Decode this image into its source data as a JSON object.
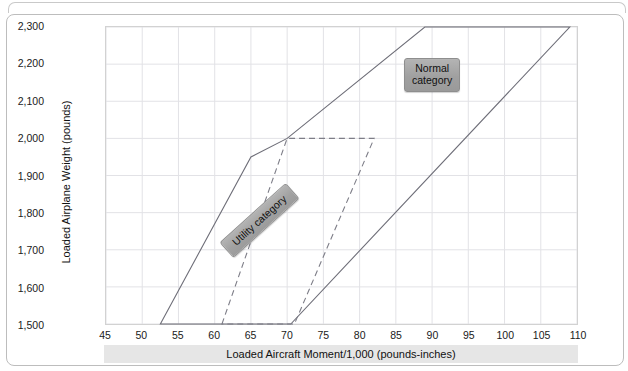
{
  "chart_data": {
    "type": "line",
    "title": "",
    "xlabel": "Loaded Aircraft Moment/1,000 (pounds-inches)",
    "ylabel": "Loaded  Airplane Weight (pounds)",
    "xlim": [
      45,
      110
    ],
    "ylim": [
      1500,
      2300
    ],
    "xticks": [
      45,
      50,
      55,
      60,
      65,
      70,
      75,
      80,
      85,
      90,
      95,
      100,
      105,
      110
    ],
    "yticks": [
      1500,
      1600,
      1700,
      1800,
      1900,
      2000,
      2100,
      2200,
      2300
    ],
    "xtick_labels": [
      "45",
      "50",
      "55",
      "60",
      "65",
      "70",
      "75",
      "80",
      "85",
      "90",
      "95",
      "100",
      "105",
      "110"
    ],
    "ytick_labels": [
      "1,500",
      "1,600",
      "1,700",
      "1,800",
      "1,900",
      "2,000",
      "2,100",
      "2,200",
      "2,300"
    ],
    "grid": true,
    "legend": "none",
    "series": [
      {
        "name": "Normal category",
        "style": "solid",
        "color": "#6e6e78",
        "closed": true,
        "points": [
          [
            52.5,
            1500
          ],
          [
            65.0,
            1950
          ],
          [
            70.0,
            2000
          ],
          [
            89.0,
            2300
          ],
          [
            109.0,
            2300
          ],
          [
            70.5,
            1500
          ]
        ]
      },
      {
        "name": "Utility category",
        "style": "dashed",
        "color": "#7d7d87",
        "closed": true,
        "points": [
          [
            61.0,
            1500
          ],
          [
            70.0,
            2000
          ],
          [
            82.0,
            2000
          ],
          [
            71.0,
            1500
          ]
        ]
      }
    ],
    "annotations": [
      {
        "name": "normal-category-label",
        "text": "Normal\ncategory",
        "x": 93,
        "y": 2205
      },
      {
        "name": "utility-category-label",
        "text": "Utility category",
        "x": 67,
        "y": 1790,
        "rotation": -42
      }
    ]
  },
  "axes": {
    "y_title": "Loaded  Airplane Weight (pounds)",
    "x_title": "Loaded Aircraft Moment/1,000 (pounds-inches)"
  },
  "labels": {
    "normal_category": "Normal\ncategory",
    "utility_category": "Utility category"
  },
  "colors": {
    "normal_line": "#6e6e78",
    "utility_line": "#7d7d87",
    "grid": "#e2e2e6",
    "axis_border": "#d2d2d2",
    "label_box": "#a4a4a4",
    "band": "#e6e6e6"
  }
}
